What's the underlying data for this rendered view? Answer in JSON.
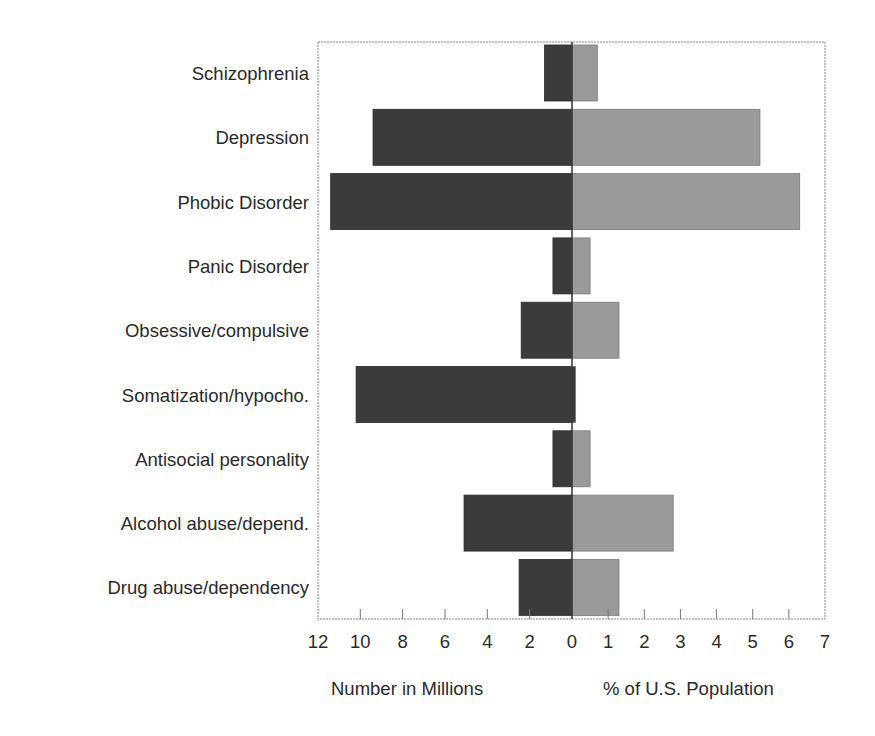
{
  "chart_data": {
    "type": "bar",
    "orientation": "horizontal",
    "layout": "back-to-back",
    "title": "",
    "categories": [
      "Schizophrenia",
      "Depression",
      "Phobic Disorder",
      "Panic Disorder",
      "Obsessive/compulsive",
      "Somatization/hypocho.",
      "Antisocial personality",
      "Alcohol abuse/depend.",
      "Drug abuse/dependency"
    ],
    "series": [
      {
        "name": "Number in Millions",
        "side": "left",
        "color": "#3b3b3b",
        "values": [
          1.3,
          9.4,
          11.4,
          0.9,
          2.4,
          10.2,
          0.9,
          5.1,
          2.5
        ]
      },
      {
        "name": "% of U.S. Population",
        "side": "right",
        "color": "#9a9a9a",
        "values": [
          0.7,
          5.2,
          6.3,
          0.5,
          1.3,
          0.1,
          0.5,
          2.8,
          1.3
        ]
      }
    ],
    "left_axis": {
      "label": "Number in Millions",
      "range": [
        0,
        12
      ],
      "ticks": [
        12,
        10,
        8,
        6,
        4,
        2,
        0
      ],
      "reversed": true
    },
    "right_axis": {
      "label": "% of U.S. Population",
      "range": [
        0,
        7
      ],
      "ticks": [
        1,
        2,
        3,
        4,
        5,
        6,
        7
      ]
    },
    "grid": false,
    "legend": "none",
    "frame_color": "#888888",
    "center_line_color": "#333333"
  }
}
